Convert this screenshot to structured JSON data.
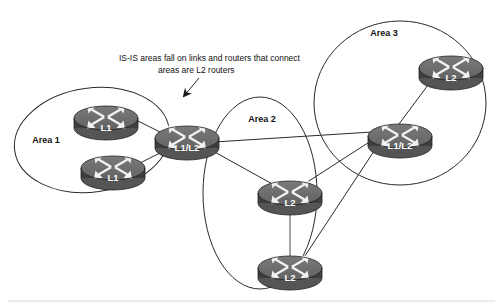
{
  "diagram": {
    "title": "IS-IS areas fall on links and routers that connect areas are L2 routers",
    "canvas": {
      "width": 503,
      "height": 308
    },
    "background_color": "#ffffff",
    "line_color": "#2a2a2a",
    "router_top_color": "#6e6e6e",
    "router_band_color": "#3e3e3e",
    "router_label_color": "#ffffff"
  },
  "annotation": {
    "name": "callout-note",
    "line1": "IS-IS areas fall on links and routers that connect",
    "line2": "areas are L2 routers",
    "points_to": "area1-border-router"
  },
  "areas": [
    {
      "id": "area-1",
      "label": "Area 1",
      "label_x": 46,
      "label_y": 140,
      "shape": "ellipse",
      "cx": 92,
      "cy": 140,
      "rx": 78,
      "ry": 52,
      "rotation": -8
    },
    {
      "id": "area-2",
      "label": "Area 2",
      "label_x": 262,
      "label_y": 122,
      "shape": "ellipse",
      "cx": 260,
      "cy": 193,
      "rx": 57,
      "ry": 96,
      "rotation": 0
    },
    {
      "id": "area-3",
      "label": "Area 3",
      "label_x": 382,
      "label_y": 35,
      "shape": "ellipse",
      "cx": 400,
      "cy": 103,
      "rx": 86,
      "ry": 82,
      "rotation": 0
    }
  ],
  "routers": [
    {
      "id": "r1",
      "name": "area1-router-top",
      "label": "L1",
      "area": "Area 1",
      "x": 74,
      "y": 105,
      "width": 64,
      "height": 34
    },
    {
      "id": "r2",
      "name": "area1-router-bottom",
      "label": "L1",
      "area": "Area 1",
      "x": 81,
      "y": 155,
      "width": 64,
      "height": 34
    },
    {
      "id": "r3",
      "name": "area1-border-router",
      "label": "L1/L2",
      "area": "Area 1",
      "x": 155,
      "y": 125,
      "width": 64,
      "height": 34
    },
    {
      "id": "r4",
      "name": "area2-router-top",
      "label": "L2",
      "area": "Area 2",
      "x": 258,
      "y": 180,
      "width": 64,
      "height": 34
    },
    {
      "id": "r5",
      "name": "area2-router-bottom",
      "label": "L2",
      "area": "Area 2",
      "x": 258,
      "y": 255,
      "width": 64,
      "height": 34
    },
    {
      "id": "r6",
      "name": "area3-border-router",
      "label": "L1/L2",
      "area": "Area 3",
      "x": 368,
      "y": 123,
      "width": 64,
      "height": 34
    },
    {
      "id": "r7",
      "name": "area3-router-top",
      "label": "L2",
      "area": "Area 3",
      "x": 419,
      "y": 55,
      "width": 64,
      "height": 34
    }
  ],
  "links": [
    {
      "id": "l1",
      "from": "area1-router-top",
      "to": "area1-border-router",
      "style": "dark"
    },
    {
      "id": "l2",
      "from": "area1-router-bottom",
      "to": "area1-border-router",
      "style": "dark"
    },
    {
      "id": "l3",
      "from": "area1-border-router",
      "to": "area2-router-top",
      "style": "dark"
    },
    {
      "id": "l4",
      "from": "area1-border-router",
      "to": "area3-border-router",
      "style": "dark"
    },
    {
      "id": "l5",
      "from": "area2-router-top",
      "to": "area3-border-router",
      "style": "dark"
    },
    {
      "id": "l6",
      "from": "area2-router-top",
      "to": "area2-router-bottom",
      "style": "light"
    },
    {
      "id": "l7",
      "from": "area2-router-bottom",
      "to": "area3-border-router",
      "style": "dark"
    },
    {
      "id": "l8",
      "from": "area3-border-router",
      "to": "area3-router-top",
      "style": "dark"
    }
  ]
}
